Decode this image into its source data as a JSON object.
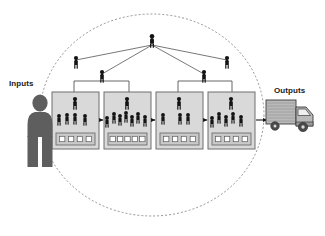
{
  "diagram": {
    "labels": {
      "inputs": "Inputs",
      "outputs": "Outputs"
    },
    "colors": {
      "background": "#ffffff",
      "figure_dark": "#141414",
      "figure_gray": "#5e5e5e",
      "box_fill": "#d9d9d9",
      "box_stroke": "#6e6e6e",
      "tray_fill": "#c9c9c9",
      "tray_square": "#ffffff",
      "boundary_stroke": "#7a7a7a",
      "connector_stroke": "#555555",
      "arrow_fill": "#1a1a1a",
      "truck_body": "#b9b9b9",
      "truck_outline": "#3a3a3a",
      "label_text": "#1a1a1a"
    },
    "boundary": {
      "shape": "dashed-ellipse",
      "cx": 152,
      "cy": 115,
      "rx": 112,
      "ry": 101,
      "dash": "2 2"
    },
    "inputs_figure": {
      "name": "input-person",
      "x": 30,
      "y": 95,
      "height": 72
    },
    "outputs_figure": {
      "name": "delivery-truck",
      "x": 266,
      "y": 100,
      "width": 52,
      "height": 42
    },
    "hierarchy": {
      "executive": {
        "name": "executive",
        "x": 152,
        "y": 34
      },
      "subordinates": [
        {
          "name": "manager-far-left",
          "x": 76,
          "y": 56
        },
        {
          "name": "supervisor-left",
          "x": 102,
          "y": 70
        },
        {
          "name": "supervisor-right",
          "x": 204,
          "y": 70
        },
        {
          "name": "manager-far-right",
          "x": 227,
          "y": 56
        }
      ],
      "brackets": [
        {
          "name": "bracket-left",
          "from_x": 74,
          "to_x": 129,
          "stem_x": 102,
          "y": 81
        },
        {
          "name": "bracket-right",
          "from_x": 178,
          "to_x": 232,
          "stem_x": 204,
          "y": 81
        }
      ]
    },
    "workstations": [
      {
        "id": 1,
        "name": "workstation-1",
        "x": 52,
        "y": 92,
        "w": 47,
        "h": 57,
        "supervisor": {
          "x": 75,
          "y": 97
        },
        "workers": [
          {
            "x": 59,
            "y": 114
          },
          {
            "x": 67,
            "y": 113
          },
          {
            "x": 75,
            "y": 113
          },
          {
            "x": 85,
            "y": 114
          }
        ],
        "worker_count": 4,
        "tray": {
          "x": 56,
          "y": 133,
          "w": 39,
          "h": 12,
          "squares": 4
        }
      },
      {
        "id": 2,
        "name": "workstation-2",
        "x": 104,
        "y": 92,
        "w": 47,
        "h": 57,
        "supervisor": {
          "x": 127,
          "y": 97
        },
        "workers": [
          {
            "x": 107,
            "y": 116
          },
          {
            "x": 114,
            "y": 112
          },
          {
            "x": 120,
            "y": 114
          },
          {
            "x": 126,
            "y": 111
          },
          {
            "x": 132,
            "y": 115
          },
          {
            "x": 138,
            "y": 112
          },
          {
            "x": 145,
            "y": 115
          }
        ],
        "worker_count": 7,
        "tray": {
          "x": 108,
          "y": 133,
          "w": 39,
          "h": 12,
          "squares": 5
        }
      },
      {
        "id": 3,
        "name": "workstation-3",
        "x": 156,
        "y": 92,
        "w": 47,
        "h": 57,
        "supervisor": {
          "x": 179,
          "y": 97
        },
        "workers": [
          {
            "x": 163,
            "y": 113
          },
          {
            "x": 180,
            "y": 113
          },
          {
            "x": 188,
            "y": 113
          }
        ],
        "worker_count": 3,
        "tray": {
          "x": 160,
          "y": 133,
          "w": 39,
          "h": 12,
          "squares": 4
        }
      },
      {
        "id": 4,
        "name": "workstation-4",
        "x": 208,
        "y": 92,
        "w": 47,
        "h": 57,
        "supervisor": {
          "x": 231,
          "y": 97
        },
        "workers": [
          {
            "x": 212,
            "y": 116
          },
          {
            "x": 219,
            "y": 112
          },
          {
            "x": 226,
            "y": 115
          },
          {
            "x": 233,
            "y": 112
          },
          {
            "x": 241,
            "y": 115
          }
        ],
        "worker_count": 5,
        "tray": {
          "x": 212,
          "y": 133,
          "w": 39,
          "h": 12,
          "squares": 4
        }
      }
    ],
    "flow_arrows": [
      {
        "name": "arrow-input-to-ws1",
        "x1": 40,
        "x2": 51,
        "y": 120
      },
      {
        "name": "arrow-ws1-to-ws2",
        "x1": 99,
        "x2": 103,
        "y": 120
      },
      {
        "name": "arrow-ws2-to-ws3",
        "x1": 151,
        "x2": 155,
        "y": 120
      },
      {
        "name": "arrow-ws3-to-ws4",
        "x1": 203,
        "x2": 207,
        "y": 120
      },
      {
        "name": "arrow-ws4-to-output",
        "x1": 256,
        "x2": 267,
        "y": 120
      }
    ]
  }
}
